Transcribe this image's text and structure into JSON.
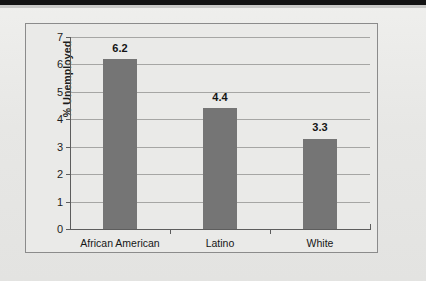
{
  "chart_data": {
    "type": "bar",
    "title": "",
    "subtitle": "",
    "xlabel": "",
    "ylabel": "% Unemployed",
    "categories": [
      "African American",
      "Latino",
      "White"
    ],
    "values": [
      6.2,
      4.4,
      3.3
    ],
    "value_labels": [
      "6.2",
      "4.4",
      "3.3"
    ],
    "ylim": [
      0,
      7
    ],
    "ytick_labels": [
      "0",
      "1",
      "2",
      "3",
      "4",
      "5",
      "6",
      "7"
    ],
    "ytick_values": [
      0,
      1,
      2,
      3,
      4,
      5,
      6,
      7
    ],
    "grid": "horizontal",
    "legend": "none",
    "bar_color": "#757575",
    "plot_background": "#eaeae8",
    "gridline_color": "#a6a6a4",
    "axis_color": "#5d5d5d",
    "frame_color": "#8b8b8b"
  }
}
